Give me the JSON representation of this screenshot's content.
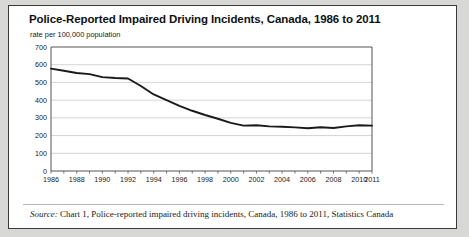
{
  "figure": {
    "title": "Police-Reported Impaired Driving Incidents, Canada, 1986 to 2011",
    "subtitle": "rate per 100,000 population",
    "source_label": "Source:",
    "source_text": " Chart 1, Police-reported impaired driving incidents, Canada, 1986 to 2011, Statistics Canada",
    "line_color": "#1a1a1a",
    "grid_color": "#c9c9c9",
    "axis_color": "#555555",
    "panel_background": "#ffffff",
    "page_background": "#d8d8d6",
    "border_color": "#3a3a3a"
  },
  "chart_data": {
    "type": "line",
    "title": "Police-Reported Impaired Driving Incidents, Canada, 1986 to 2011",
    "subtitle": "rate per 100,000 population",
    "xlabel": "",
    "ylabel": "rate per 100,000 population",
    "ylim": [
      0,
      700
    ],
    "xlim": [
      1986,
      2011
    ],
    "yticks": [
      0,
      100,
      200,
      300,
      400,
      500,
      600,
      700
    ],
    "ytick_labels": [
      "0",
      "100",
      "200",
      "300",
      "400",
      "500",
      "600",
      "700"
    ],
    "xtick_labels": [
      "1986",
      "1988",
      "1990",
      "1992",
      "1994",
      "1996",
      "1998",
      "2000",
      "2002",
      "2004",
      "2006",
      "2008",
      "2010",
      "2011"
    ],
    "xtick_values": [
      1986,
      1988,
      1990,
      1992,
      1994,
      1996,
      1998,
      2000,
      2002,
      2004,
      2006,
      2008,
      2010,
      2011
    ],
    "minor_ticks_every": 1,
    "grid": "horizontal",
    "legend": "none",
    "x": [
      1986,
      1987,
      1988,
      1989,
      1990,
      1991,
      1992,
      1993,
      1994,
      1995,
      1996,
      1997,
      1998,
      1999,
      2000,
      2001,
      2002,
      2003,
      2004,
      2005,
      2006,
      2007,
      2008,
      2009,
      2010,
      2011
    ],
    "values": [
      578,
      566,
      553,
      547,
      530,
      525,
      522,
      480,
      432,
      400,
      368,
      340,
      316,
      295,
      272,
      256,
      258,
      252,
      250,
      246,
      241,
      247,
      243,
      252,
      258,
      256
    ],
    "series": [
      {
        "name": "Impaired driving incidents rate",
        "values": [
          578,
          566,
          553,
          547,
          530,
          525,
          522,
          480,
          432,
          400,
          368,
          340,
          316,
          295,
          272,
          256,
          258,
          252,
          250,
          246,
          241,
          247,
          243,
          252,
          258,
          256
        ]
      }
    ]
  }
}
